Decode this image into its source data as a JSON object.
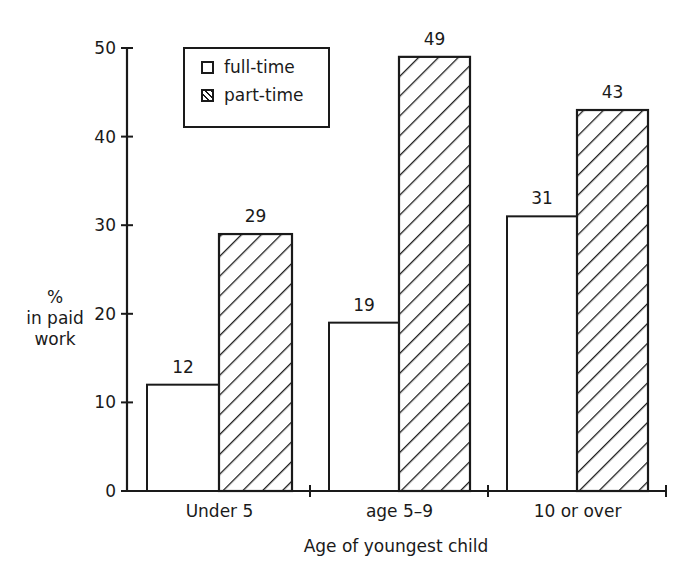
{
  "chart_data": {
    "type": "bar",
    "title": "",
    "xlabel": "Age of youngest child",
    "ylabel": "% in paid work",
    "ylabel_lines": [
      "%",
      "in paid",
      "work"
    ],
    "ylim": [
      0,
      50
    ],
    "yticks": [
      0,
      10,
      20,
      30,
      40,
      50
    ],
    "grid": false,
    "legend_position": "top-left inside",
    "categories": [
      "Under 5",
      "age 5–9",
      "10 or over"
    ],
    "series": [
      {
        "name": "full-time",
        "pattern": "plain",
        "values": [
          12,
          19,
          31
        ]
      },
      {
        "name": "part-time",
        "pattern": "diagonal-hatch",
        "values": [
          29,
          49,
          43
        ]
      }
    ]
  },
  "legend": {
    "items": [
      {
        "label": "full-time"
      },
      {
        "label": "part-time"
      }
    ]
  },
  "colors": {
    "ink": "#1a1a1a",
    "background": "#ffffff"
  }
}
